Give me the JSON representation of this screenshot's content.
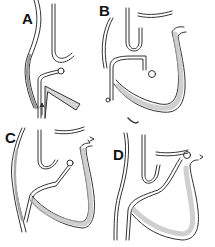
{
  "figure": {
    "panels": [
      {
        "id": "A",
        "label": "A"
      },
      {
        "id": "B",
        "label": "B"
      },
      {
        "id": "C",
        "label": "C"
      },
      {
        "id": "D",
        "label": "D"
      }
    ],
    "colors": {
      "line": "#333333",
      "fill": "#d6d6d6",
      "background": "#ffffff"
    }
  }
}
